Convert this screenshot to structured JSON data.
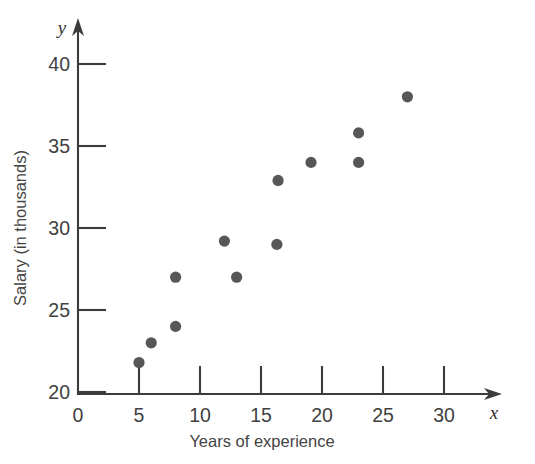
{
  "chart_data": {
    "type": "scatter",
    "title": "",
    "xlabel": "Years of experience",
    "ylabel": "Salary (in thousands)",
    "x_axis_symbol": "x",
    "y_axis_symbol": "y",
    "xlim": [
      0,
      32.5
    ],
    "ylim": [
      20,
      41.5
    ],
    "xticks": [
      0,
      5,
      10,
      15,
      20,
      25,
      30
    ],
    "xtick_labels": [
      "0",
      "5",
      "10",
      "15",
      "20",
      "25",
      "30"
    ],
    "yticks": [
      20,
      25,
      30,
      35,
      40
    ],
    "ytick_labels": [
      "20",
      "25",
      "30",
      "35",
      "40"
    ],
    "grid": false,
    "legend": null,
    "marker_color": "#575757",
    "axis_color": "#3c3c3c",
    "points": [
      {
        "x": 5,
        "y": 21.8
      },
      {
        "x": 6,
        "y": 23.0
      },
      {
        "x": 8,
        "y": 24.0
      },
      {
        "x": 8,
        "y": 27.0
      },
      {
        "x": 12,
        "y": 29.2
      },
      {
        "x": 13,
        "y": 27.0
      },
      {
        "x": 16.4,
        "y": 32.9
      },
      {
        "x": 16.3,
        "y": 29.0
      },
      {
        "x": 19.1,
        "y": 34.0
      },
      {
        "x": 23,
        "y": 34.0
      },
      {
        "x": 23,
        "y": 35.8
      },
      {
        "x": 27,
        "y": 38.0
      }
    ]
  }
}
